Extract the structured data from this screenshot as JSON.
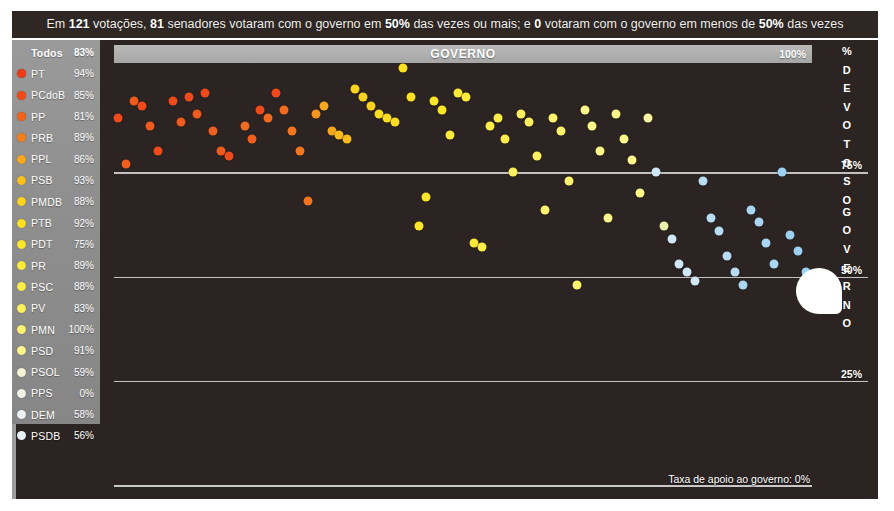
{
  "headline": {
    "parts": [
      {
        "t": "Em ",
        "b": false
      },
      {
        "t": "121",
        "b": true
      },
      {
        "t": " votações, ",
        "b": false
      },
      {
        "t": "81",
        "b": true
      },
      {
        "t": " senadores votaram com o governo em ",
        "b": false
      },
      {
        "t": "50%",
        "b": true
      },
      {
        "t": " das vezes ou mais; e ",
        "b": false
      },
      {
        "t": "0",
        "b": true
      },
      {
        "t": " votaram com o governo em menos de ",
        "b": false
      },
      {
        "t": "50%",
        "b": true
      },
      {
        "t": " das vezes",
        "b": false
      }
    ],
    "plain": "Em 121 votações, 81 senadores votaram com o governo em 50% das vezes ou mais; e 0 votaram com o governo em menos de 50% das vezes"
  },
  "sidebar": {
    "header": {
      "label": "Todos",
      "pct": "83%",
      "color": "#b9b9b9"
    },
    "items": [
      {
        "label": "PT",
        "pct": "94%",
        "color": "#ee3b16"
      },
      {
        "label": "PCdoB",
        "pct": "85%",
        "color": "#f04a16"
      },
      {
        "label": "PP",
        "pct": "81%",
        "color": "#f2621a"
      },
      {
        "label": "PRB",
        "pct": "89%",
        "color": "#f4801c"
      },
      {
        "label": "PPL",
        "pct": "86%",
        "color": "#f7a81e"
      },
      {
        "label": "PSB",
        "pct": "93%",
        "color": "#f9c01f"
      },
      {
        "label": "PMDB",
        "pct": "88%",
        "color": "#fad221"
      },
      {
        "label": "PTB",
        "pct": "92%",
        "color": "#fbe023"
      },
      {
        "label": "PDT",
        "pct": "75%",
        "color": "#fbe62c"
      },
      {
        "label": "PR",
        "pct": "89%",
        "color": "#fbea3a"
      },
      {
        "label": "PSC",
        "pct": "88%",
        "color": "#fcee4a"
      },
      {
        "label": "PV",
        "pct": "83%",
        "color": "#fcf05e"
      },
      {
        "label": "PMN",
        "pct": "100%",
        "color": "#fdf36e"
      },
      {
        "label": "PSD",
        "pct": "91%",
        "color": "#fdf68a"
      },
      {
        "label": "PSOL",
        "pct": "59%",
        "color": "#f4f3d8"
      },
      {
        "label": "PPS",
        "pct": "0%",
        "color": "#f2f2e8"
      },
      {
        "label": "DEM",
        "pct": "58%",
        "color": "#eef2f2"
      },
      {
        "label": "PSDB",
        "pct": "56%",
        "color": "#e8f1f4"
      }
    ]
  },
  "chart_header": {
    "title": "GOVERNO",
    "top_pct": "100%"
  },
  "axis": {
    "vertical_label": "% DE VOTOS",
    "vertical_label2": "O GOVERNO",
    "vertical_letters": [
      "%",
      "D",
      "E",
      "V",
      "O",
      "T",
      "O",
      "S",
      "O",
      "G",
      "O",
      "V",
      "E",
      "R",
      "N",
      "O"
    ],
    "ticks": [
      {
        "label": "75%",
        "value": 75
      },
      {
        "label": "50%",
        "value": 50
      },
      {
        "label": "25%",
        "value": 25
      }
    ]
  },
  "footer": {
    "note": "Taxa de apoio ao governo: 0%"
  },
  "chart_data": {
    "type": "scatter",
    "title": "GOVERNO",
    "xlabel": "Senadores",
    "ylabel": "% DE VOTOS COM O GOVERNO",
    "ylim": [
      0,
      100
    ],
    "yticks": [
      25,
      50,
      75,
      100
    ],
    "grid": true,
    "legend": "sidebar party list with support rates",
    "colormap": "red (high support) → orange → yellow → white → light blue (low support)",
    "n_points": 81,
    "points": [
      {
        "x": 2,
        "y": 88,
        "c": "#ee4a1c"
      },
      {
        "x": 4,
        "y": 92,
        "c": "#ef5a1e"
      },
      {
        "x": 5,
        "y": 91,
        "c": "#ee4a1c"
      },
      {
        "x": 6,
        "y": 86,
        "c": "#ef5a1e"
      },
      {
        "x": 7,
        "y": 80,
        "c": "#ee4a1c"
      },
      {
        "x": 3,
        "y": 77,
        "c": "#ef5f22"
      },
      {
        "x": 9,
        "y": 92,
        "c": "#ee4a1c"
      },
      {
        "x": 10,
        "y": 87,
        "c": "#ef5a1e"
      },
      {
        "x": 11,
        "y": 93,
        "c": "#ee4a1c"
      },
      {
        "x": 12,
        "y": 89,
        "c": "#ef5a1e"
      },
      {
        "x": 13,
        "y": 94,
        "c": "#ee4a1c"
      },
      {
        "x": 14,
        "y": 85,
        "c": "#ef5f22"
      },
      {
        "x": 15,
        "y": 80,
        "c": "#ef5a1e"
      },
      {
        "x": 16,
        "y": 79,
        "c": "#ee4a1c"
      },
      {
        "x": 18,
        "y": 86,
        "c": "#f06a20"
      },
      {
        "x": 19,
        "y": 83,
        "c": "#ef5f22"
      },
      {
        "x": 20,
        "y": 90,
        "c": "#ee4a1c"
      },
      {
        "x": 21,
        "y": 88,
        "c": "#f06a20"
      },
      {
        "x": 22,
        "y": 94,
        "c": "#ee4a1c"
      },
      {
        "x": 23,
        "y": 90,
        "c": "#f06a20"
      },
      {
        "x": 24,
        "y": 85,
        "c": "#f2761f"
      },
      {
        "x": 25,
        "y": 80,
        "c": "#f2761f"
      },
      {
        "x": 26,
        "y": 68,
        "c": "#f2761f"
      },
      {
        "x": 27,
        "y": 89,
        "c": "#f5941f"
      },
      {
        "x": 28,
        "y": 91,
        "c": "#f7a81e"
      },
      {
        "x": 29,
        "y": 85,
        "c": "#f7a81e"
      },
      {
        "x": 30,
        "y": 84,
        "c": "#f9bb1f"
      },
      {
        "x": 31,
        "y": 83,
        "c": "#f9bb1f"
      },
      {
        "x": 32,
        "y": 95,
        "c": "#fad221"
      },
      {
        "x": 33,
        "y": 93,
        "c": "#fad221"
      },
      {
        "x": 34,
        "y": 91,
        "c": "#fad221"
      },
      {
        "x": 35,
        "y": 89,
        "c": "#fbdd23"
      },
      {
        "x": 36,
        "y": 88,
        "c": "#fbdd23"
      },
      {
        "x": 37,
        "y": 87,
        "c": "#fbdd23"
      },
      {
        "x": 38,
        "y": 100,
        "c": "#fbe023"
      },
      {
        "x": 39,
        "y": 93,
        "c": "#fbe023"
      },
      {
        "x": 40,
        "y": 62,
        "c": "#fbe62c"
      },
      {
        "x": 41,
        "y": 69,
        "c": "#fbe62c"
      },
      {
        "x": 42,
        "y": 92,
        "c": "#fbe62c"
      },
      {
        "x": 43,
        "y": 90,
        "c": "#fbe62c"
      },
      {
        "x": 44,
        "y": 84,
        "c": "#fbea3a"
      },
      {
        "x": 45,
        "y": 94,
        "c": "#fbea3a"
      },
      {
        "x": 46,
        "y": 93,
        "c": "#fbea3a"
      },
      {
        "x": 47,
        "y": 58,
        "c": "#fbea3a"
      },
      {
        "x": 48,
        "y": 57,
        "c": "#fcee4a"
      },
      {
        "x": 49,
        "y": 86,
        "c": "#fcee4a"
      },
      {
        "x": 50,
        "y": 88,
        "c": "#fcee4a"
      },
      {
        "x": 51,
        "y": 83,
        "c": "#fcee4a"
      },
      {
        "x": 52,
        "y": 75,
        "c": "#fcf05e"
      },
      {
        "x": 53,
        "y": 89,
        "c": "#fcf05e"
      },
      {
        "x": 54,
        "y": 87,
        "c": "#fcf05e"
      },
      {
        "x": 55,
        "y": 79,
        "c": "#fcf05e"
      },
      {
        "x": 56,
        "y": 66,
        "c": "#fdf36e"
      },
      {
        "x": 57,
        "y": 88,
        "c": "#fdf36e"
      },
      {
        "x": 58,
        "y": 85,
        "c": "#fdf36e"
      },
      {
        "x": 59,
        "y": 73,
        "c": "#fdf36e"
      },
      {
        "x": 60,
        "y": 48,
        "c": "#fdf36e"
      },
      {
        "x": 61,
        "y": 90,
        "c": "#fdf68a"
      },
      {
        "x": 62,
        "y": 86,
        "c": "#fdf68a"
      },
      {
        "x": 63,
        "y": 80,
        "c": "#fdf68a"
      },
      {
        "x": 64,
        "y": 64,
        "c": "#fdf68a"
      },
      {
        "x": 65,
        "y": 89,
        "c": "#fdf68a"
      },
      {
        "x": 66,
        "y": 83,
        "c": "#fdf68a"
      },
      {
        "x": 67,
        "y": 78,
        "c": "#fdf68a"
      },
      {
        "x": 68,
        "y": 70,
        "c": "#fdf68a"
      },
      {
        "x": 69,
        "y": 88,
        "c": "#faf5a0"
      },
      {
        "x": 70,
        "y": 75,
        "c": "#cfe7f6"
      },
      {
        "x": 71,
        "y": 62,
        "c": "#e8f2a8"
      },
      {
        "x": 72,
        "y": 59,
        "c": "#cfe7f6"
      },
      {
        "x": 73,
        "y": 53,
        "c": "#cfe7f6"
      },
      {
        "x": 74,
        "y": 51,
        "c": "#cfe7f6"
      },
      {
        "x": 75,
        "y": 49,
        "c": "#cfe7f6"
      },
      {
        "x": 76,
        "y": 73,
        "c": "#b7dcf4"
      },
      {
        "x": 77,
        "y": 64,
        "c": "#b7dcf4"
      },
      {
        "x": 78,
        "y": 61,
        "c": "#b7dcf4"
      },
      {
        "x": 79,
        "y": 55,
        "c": "#b7dcf4"
      },
      {
        "x": 80,
        "y": 51,
        "c": "#b7dcf4"
      },
      {
        "x": 81,
        "y": 48,
        "c": "#a9d6f2"
      },
      {
        "x": 82,
        "y": 66,
        "c": "#a9d6f2"
      },
      {
        "x": 83,
        "y": 63,
        "c": "#a9d6f2"
      },
      {
        "x": 84,
        "y": 58,
        "c": "#a9d6f2"
      },
      {
        "x": 85,
        "y": 53,
        "c": "#a9d6f2"
      },
      {
        "x": 86,
        "y": 75,
        "c": "#9ed1f0"
      },
      {
        "x": 87,
        "y": 60,
        "c": "#9ed1f0"
      },
      {
        "x": 88,
        "y": 56,
        "c": "#9ed1f0"
      },
      {
        "x": 89,
        "y": 51,
        "c": "#9ed1f0"
      }
    ]
  }
}
